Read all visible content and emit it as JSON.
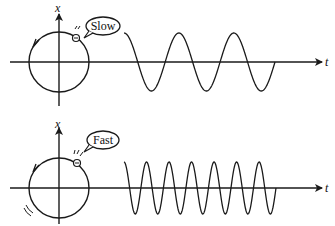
{
  "panels": [
    {
      "id": "slow",
      "bubble_label": "Slow",
      "x_axis_label": "x",
      "t_axis_label": "t",
      "rotation_direction": "counterclockwise",
      "wave_cycles": 2.75,
      "description": "Slowly rotating point on circle produces low-frequency sine wave"
    },
    {
      "id": "fast",
      "bubble_label": "Fast",
      "x_axis_label": "x",
      "t_axis_label": "t",
      "rotation_direction": "counterclockwise",
      "wave_cycles": 6.75,
      "description": "Fast rotating point on circle produces high-frequency sine wave"
    }
  ],
  "colors": {
    "stroke": "#1a1a1a",
    "background": "#ffffff"
  }
}
